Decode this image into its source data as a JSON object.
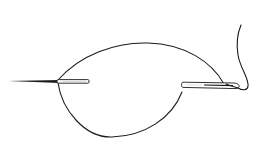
{
  "figure": {
    "title": "Needle and thread stitch illustration",
    "colors": {
      "background": "#ffffff",
      "ink": "#1a1a1a",
      "needle_highlight": "#e8e8e8"
    },
    "elements": [
      {
        "name": "left-needle-point",
        "description": "needle tip emerging from fabric"
      },
      {
        "name": "right-needle-eye",
        "description": "needle with threaded eye"
      },
      {
        "name": "thread-loop",
        "description": "thread forming a loop between needles"
      },
      {
        "name": "thread-tail",
        "description": "loose thread tail from needle eye"
      }
    ]
  }
}
